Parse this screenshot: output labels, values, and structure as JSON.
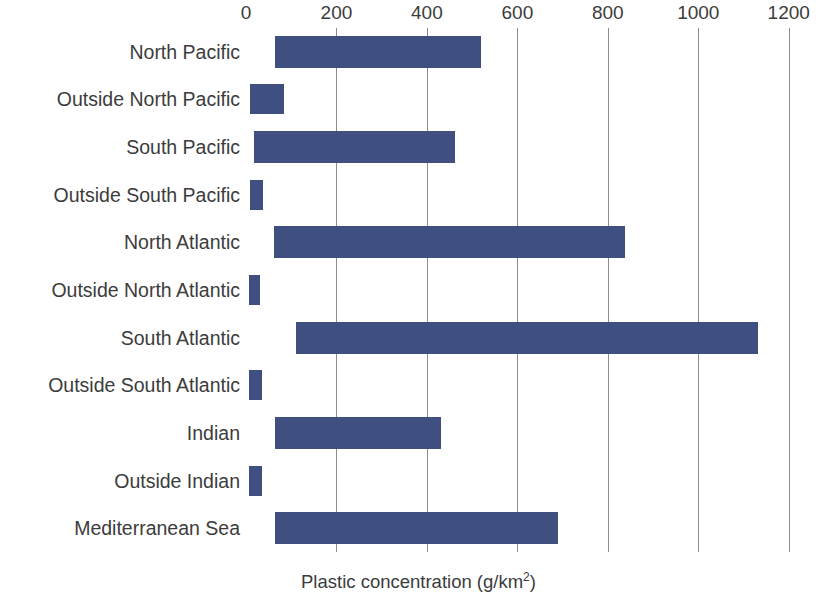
{
  "chart_data": {
    "type": "bar",
    "orientation": "horizontal",
    "bar_style": "floating-range",
    "title": "",
    "subtitle": "",
    "xlabel": "Plastic concentration (g/km2)",
    "xlabel_display": "Plastic concentration (g/km",
    "xlabel_superscript": "2",
    "xlabel_suffix": ")",
    "ylabel": "",
    "xlim": [
      0,
      1205
    ],
    "ylim": null,
    "grid": "vertical",
    "legend": "none",
    "bar_color": "#3E4F80",
    "gridline_color": "#8C8C8C",
    "background_color": "#FFFFFF",
    "text_color": "#3C3C3C",
    "xticks": [
      0,
      200,
      400,
      600,
      800,
      1000,
      1200
    ],
    "xtick_labels": [
      "0",
      "200",
      "400",
      "600",
      "800",
      "1000",
      "1200"
    ],
    "categories": [
      "North Pacific",
      "Outside North Pacific",
      "South Pacific",
      "Outside South Pacific",
      "North Atlantic",
      "Outside North Atlantic",
      "South Atlantic",
      "Outside South Atlantic",
      "Indian",
      "Outside Indian",
      "Mediterranean Sea"
    ],
    "ranges": [
      {
        "category": "North Pacific",
        "low": 65,
        "high": 520
      },
      {
        "category": "Outside North Pacific",
        "low": 8,
        "high": 85
      },
      {
        "category": "South Pacific",
        "low": 18,
        "high": 462
      },
      {
        "category": "Outside South Pacific",
        "low": 8,
        "high": 38
      },
      {
        "category": "North Atlantic",
        "low": 62,
        "high": 838
      },
      {
        "category": "Outside North Atlantic",
        "low": 6,
        "high": 32
      },
      {
        "category": "South Atlantic",
        "low": 110,
        "high": 1132
      },
      {
        "category": "Outside South Atlantic",
        "low": 6,
        "high": 36
      },
      {
        "category": "Indian",
        "low": 65,
        "high": 432
      },
      {
        "category": "Outside Indian",
        "low": 7,
        "high": 36
      },
      {
        "category": "Mediterranean Sea",
        "low": 65,
        "high": 690
      }
    ],
    "values": [
      520,
      85,
      462,
      38,
      838,
      32,
      1132,
      36,
      432,
      36,
      690
    ],
    "lows": [
      65,
      8,
      18,
      8,
      62,
      6,
      110,
      6,
      65,
      7,
      65
    ]
  }
}
